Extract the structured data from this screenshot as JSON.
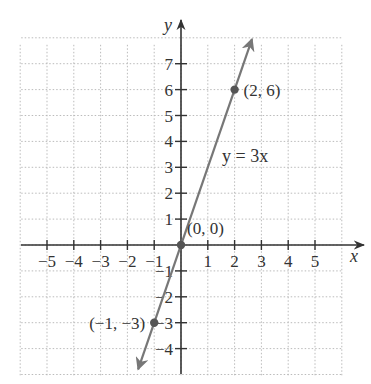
{
  "chart_data": {
    "type": "line",
    "title": "",
    "xlabel": "x",
    "ylabel": "y",
    "xlim": [
      -6,
      6
    ],
    "ylim": [
      -5,
      8
    ],
    "grid": true,
    "x_ticks": [
      -5,
      -4,
      -3,
      -2,
      -1,
      1,
      2,
      3,
      4,
      5
    ],
    "x_tick_labels": [
      "−5",
      "−4",
      "−3",
      "−2",
      "−1",
      "1",
      "2",
      "3",
      "4",
      "5"
    ],
    "y_ticks": [
      7,
      6,
      5,
      4,
      3,
      2,
      1,
      -1,
      -2,
      -3,
      -4
    ],
    "y_tick_labels": [
      "7",
      "6",
      "5",
      "4",
      "3",
      "2",
      "1",
      "−1",
      "−2",
      "−3",
      "−4"
    ],
    "series": [
      {
        "name": "y = 3x",
        "equation": "y = 3x",
        "slope": 3,
        "intercept": 0,
        "x_range": [
          -1.6,
          2.65
        ],
        "arrows": "both"
      }
    ],
    "points": [
      {
        "x": 2,
        "y": 6,
        "label": "(2, 6)"
      },
      {
        "x": 0,
        "y": 0,
        "label": "(0, 0)"
      },
      {
        "x": -1,
        "y": -3,
        "label": "(−1, −3)"
      }
    ],
    "annotations": [
      {
        "text": "y = 3x"
      }
    ],
    "colors": {
      "line": "#777777",
      "axis": "#333333",
      "grid": "#bbbbbb",
      "point": "#555555"
    }
  }
}
